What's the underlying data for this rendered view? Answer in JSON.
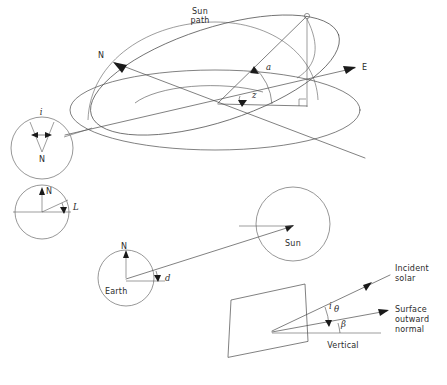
{
  "figure": {
    "background_color": "#ffffff",
    "line_color": "#4a4a4a",
    "text_color": "#2b2b2b",
    "width": 447,
    "height": 385
  },
  "celestial_sphere": {
    "sun_path_label_line1": "Sun",
    "sun_path_label_line2": "path",
    "north_axis_label": "N",
    "east_axis_label": "E",
    "altitude_angle_label": "a",
    "azimuth_angle_label": "z",
    "right_angle_marker": "□"
  },
  "inset_hour_angle": {
    "angle_label": "i",
    "pole_label": "N"
  },
  "inset_latitude": {
    "north_label": "N",
    "angle_label": "L"
  },
  "earth_sun": {
    "earth_label": "Earth",
    "earth_north_label": "N",
    "sun_label": "Sun",
    "declination_label": "d"
  },
  "surface_panel": {
    "incident_solar_line1": "Incident",
    "incident_solar_line2": "solar",
    "surface_normal_line1": "Surface",
    "surface_normal_line2": "outward",
    "surface_normal_line3": "normal",
    "vertical_label": "Vertical",
    "incidence_angle_label": "i",
    "theta_angle_label": "θ",
    "tilt_angle_label": "β"
  }
}
